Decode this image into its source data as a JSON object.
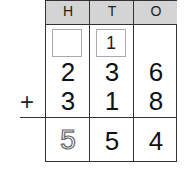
{
  "table": {
    "headers": [
      "H",
      "T",
      "O"
    ],
    "carry_row": {
      "H": "",
      "T": "1",
      "O": ""
    },
    "addend1": [
      "2",
      "3",
      "6"
    ],
    "addend2": [
      "3",
      "1",
      "8"
    ],
    "operator": "+",
    "sum": [
      "5",
      "5",
      "4"
    ],
    "sum_hundreds_style": "dotted-trace"
  }
}
